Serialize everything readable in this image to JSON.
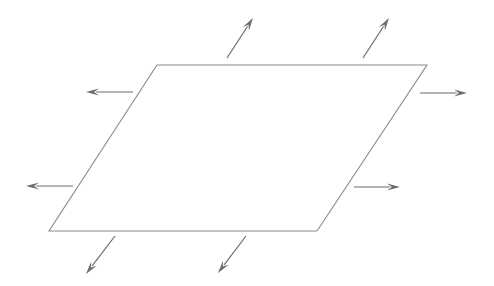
{
  "figure": {
    "name": "parallelogram-expansion-diagram",
    "caption": "",
    "canvas": {
      "width": 494,
      "height": 286,
      "background": "#ffffff"
    },
    "colors": {
      "shape_stroke": "#8a8a8a",
      "arrow_stroke": "#6b6b6b",
      "arrow_fill": "#6b6b6b",
      "background": "#ffffff"
    },
    "shape": {
      "name": "parallelogram",
      "type": "polygon",
      "stroke_width": 1.1,
      "points": [
        {
          "label": "top-left",
          "x": 157,
          "y": 65
        },
        {
          "label": "top-right",
          "x": 427,
          "y": 65
        },
        {
          "label": "bottom-right",
          "x": 317,
          "y": 231
        },
        {
          "label": "bottom-left",
          "x": 49,
          "y": 231
        }
      ]
    },
    "arrows": [
      {
        "name": "arrow-top-left",
        "direction": "up-right",
        "stroke_width": 1.2,
        "head_length": 13,
        "head_width": 7,
        "x1": 227,
        "y1": 58,
        "x2": 253,
        "y2": 18
      },
      {
        "name": "arrow-top-right",
        "direction": "up-right",
        "stroke_width": 1.2,
        "head_length": 13,
        "head_width": 7,
        "x1": 363,
        "y1": 58,
        "x2": 389,
        "y2": 18
      },
      {
        "name": "arrow-left-upper",
        "direction": "left",
        "stroke_width": 1.2,
        "head_length": 13,
        "head_width": 7,
        "x1": 133,
        "y1": 92,
        "x2": 86,
        "y2": 92
      },
      {
        "name": "arrow-left-lower",
        "direction": "left",
        "stroke_width": 1.2,
        "head_length": 13,
        "head_width": 7,
        "x1": 73,
        "y1": 186,
        "x2": 26,
        "y2": 186
      },
      {
        "name": "arrow-right-upper",
        "direction": "right",
        "stroke_width": 1.2,
        "head_length": 13,
        "head_width": 7,
        "x1": 420,
        "y1": 93,
        "x2": 467,
        "y2": 93
      },
      {
        "name": "arrow-right-lower",
        "direction": "right",
        "stroke_width": 1.2,
        "head_length": 13,
        "head_width": 7,
        "x1": 354,
        "y1": 187,
        "x2": 400,
        "y2": 187
      },
      {
        "name": "arrow-bottom-left",
        "direction": "down-left",
        "stroke_width": 1.2,
        "head_length": 13,
        "head_width": 7,
        "x1": 115,
        "y1": 236,
        "x2": 86,
        "y2": 274
      },
      {
        "name": "arrow-bottom-right",
        "direction": "down-left",
        "stroke_width": 1.2,
        "head_length": 13,
        "head_width": 7,
        "x1": 246,
        "y1": 236,
        "x2": 218,
        "y2": 273
      }
    ]
  }
}
